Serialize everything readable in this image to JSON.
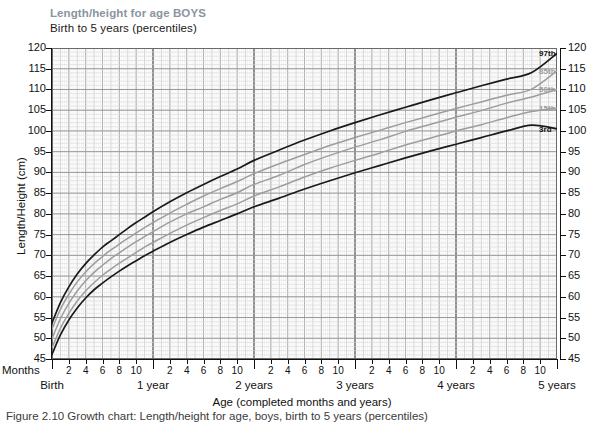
{
  "chart_data": {
    "type": "line",
    "title": "Length/height for age BOYS",
    "subtitle": "Birth to 5 years (percentiles)",
    "xlabel": "Age (completed months and years)",
    "ylabel": "Length/Height (cm)",
    "xlim": [
      0,
      60
    ],
    "ylim": [
      45,
      120
    ],
    "grid": true,
    "x_unit": "months",
    "legend_position": "right-inline",
    "y_ticks": [
      45,
      50,
      55,
      60,
      65,
      70,
      75,
      80,
      85,
      90,
      95,
      100,
      105,
      110,
      115,
      120
    ],
    "x_month_ticks": [
      2,
      4,
      6,
      8,
      10,
      14,
      16,
      18,
      20,
      22,
      26,
      28,
      30,
      32,
      34,
      38,
      40,
      42,
      44,
      46,
      50,
      52,
      54,
      56,
      58
    ],
    "x_month_tick_labels": [
      "2",
      "4",
      "6",
      "8",
      "10",
      "2",
      "4",
      "6",
      "8",
      "10",
      "2",
      "4",
      "6",
      "8",
      "10",
      "2",
      "4",
      "6",
      "8",
      "10",
      "2",
      "4",
      "6",
      "8",
      "10"
    ],
    "x_year_ticks": [
      0,
      12,
      24,
      36,
      48,
      60
    ],
    "x_year_labels": [
      "Birth",
      "1 year",
      "2 years",
      "3 years",
      "4 years",
      "5 years"
    ],
    "months_axis_label": "Months",
    "series": [
      {
        "name": "97th",
        "label": "97th",
        "color": "#1a1a1a",
        "width": 1.7,
        "x": [
          0,
          1,
          2,
          3,
          4,
          5,
          6,
          7,
          8,
          9,
          10,
          11,
          12,
          14,
          16,
          18,
          20,
          22,
          24,
          27,
          30,
          33,
          36,
          39,
          42,
          45,
          48,
          51,
          54,
          57,
          60
        ],
        "values": [
          53.7,
          58.6,
          62.4,
          65.5,
          68.0,
          70.1,
          72.0,
          73.5,
          75.0,
          76.5,
          77.9,
          79.2,
          80.5,
          82.9,
          85.1,
          87.1,
          89.0,
          90.8,
          92.9,
          95.4,
          97.8,
          100.0,
          102.0,
          103.9,
          105.7,
          107.5,
          109.2,
          110.9,
          112.5,
          114.1,
          119.0
        ],
        "endpoint_value": 118.7
      },
      {
        "name": "85th",
        "label": "85th",
        "color": "#9d9d9d",
        "width": 1.5,
        "x": [
          0,
          1,
          2,
          3,
          4,
          5,
          6,
          7,
          8,
          9,
          10,
          11,
          12,
          14,
          16,
          18,
          20,
          22,
          24,
          27,
          30,
          33,
          36,
          39,
          42,
          45,
          48,
          51,
          54,
          57,
          60
        ],
        "values": [
          52.2,
          57.0,
          60.6,
          63.6,
          66.0,
          68.0,
          69.7,
          71.3,
          72.7,
          74.1,
          75.4,
          76.7,
          77.9,
          80.2,
          82.3,
          84.3,
          86.1,
          87.8,
          89.7,
          92.1,
          94.3,
          96.5,
          98.4,
          100.2,
          102.0,
          103.7,
          105.4,
          107.0,
          108.6,
          110.1,
          114.5
        ],
        "endpoint_value": 114.5
      },
      {
        "name": "50th",
        "label": "50th",
        "color": "#9d9d9d",
        "width": 1.5,
        "x": [
          0,
          1,
          2,
          3,
          4,
          5,
          6,
          7,
          8,
          9,
          10,
          11,
          12,
          14,
          16,
          18,
          20,
          22,
          24,
          27,
          30,
          33,
          36,
          39,
          42,
          45,
          48,
          51,
          54,
          57,
          60
        ],
        "values": [
          49.9,
          54.7,
          58.4,
          61.4,
          63.9,
          65.9,
          67.6,
          69.2,
          70.6,
          72.0,
          73.3,
          74.5,
          75.7,
          78.0,
          80.0,
          81.7,
          83.5,
          85.1,
          87.1,
          89.3,
          91.9,
          94.1,
          96.1,
          97.9,
          99.9,
          101.6,
          103.3,
          104.9,
          106.7,
          108.2,
          110.0
        ],
        "endpoint_value": 110.0
      },
      {
        "name": "15th",
        "label": "15th",
        "color": "#9d9d9d",
        "width": 1.5,
        "x": [
          0,
          1,
          2,
          3,
          4,
          5,
          6,
          7,
          8,
          9,
          10,
          11,
          12,
          14,
          16,
          18,
          20,
          22,
          24,
          27,
          30,
          33,
          36,
          39,
          42,
          45,
          48,
          51,
          54,
          57,
          60
        ],
        "values": [
          47.7,
          52.4,
          56.0,
          59.0,
          61.4,
          63.4,
          65.2,
          66.7,
          68.1,
          69.4,
          70.7,
          72.0,
          73.1,
          75.3,
          77.3,
          79.1,
          80.8,
          82.4,
          84.3,
          86.5,
          88.9,
          91.0,
          92.9,
          94.7,
          96.6,
          98.3,
          100.0,
          101.5,
          103.2,
          104.7,
          105.5
        ],
        "endpoint_value": 105.5
      },
      {
        "name": "3rd",
        "label": "3rd",
        "color": "#1a1a1a",
        "width": 1.7,
        "x": [
          0,
          1,
          2,
          3,
          4,
          5,
          6,
          7,
          8,
          9,
          10,
          11,
          12,
          14,
          16,
          18,
          20,
          22,
          24,
          27,
          30,
          33,
          36,
          39,
          42,
          45,
          48,
          51,
          54,
          57,
          60
        ],
        "values": [
          46.1,
          50.8,
          54.4,
          57.3,
          59.7,
          61.7,
          63.3,
          64.8,
          66.2,
          67.5,
          68.7,
          69.9,
          71.0,
          73.1,
          75.0,
          76.8,
          78.4,
          80.0,
          81.7,
          83.8,
          86.0,
          88.0,
          89.9,
          91.7,
          93.5,
          95.2,
          96.8,
          98.4,
          100.0,
          101.4,
          100.5
        ],
        "endpoint_value": 100.5
      }
    ]
  },
  "caption": {
    "text": "Figure 2.10 Growth chart: Length/height for age, boys, birth to 5 years (percentiles)"
  }
}
